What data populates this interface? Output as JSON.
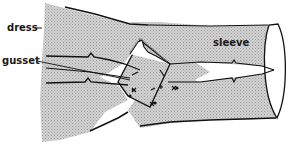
{
  "figure": {
    "labels": {
      "dress": "dress",
      "sleeve": "sleeve",
      "gusset": "gusset"
    },
    "colors": {
      "fabric_fill": "#c4c4c4",
      "outline": "#111111",
      "background": "#ffffff",
      "gusset_fill": "#cfcfcf"
    },
    "marks": {
      "stitch_symbol": "×",
      "dot_symbol": "•"
    }
  }
}
